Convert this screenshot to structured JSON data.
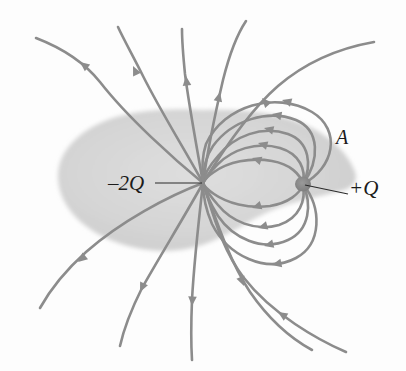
{
  "figure": {
    "background_color": "#fdfdfd",
    "field_line_color": "#8c8c8c",
    "surface_fill_color": "#d6d6d6",
    "charge_dot_color": "#8a8a8a",
    "label_color": "#1b1b1b"
  },
  "labels": {
    "negative_charge": "–2Q",
    "positive_charge": "+Q",
    "gaussian_surface": "A"
  },
  "charges": [
    {
      "name": "negative-charge",
      "label": "–2Q",
      "magnitude": "2Q",
      "sign": "negative",
      "x": 203,
      "y": 183
    },
    {
      "name": "positive-charge",
      "label": "+Q",
      "magnitude": "Q",
      "sign": "positive",
      "x": 303,
      "y": 184
    }
  ],
  "gaussian_surface": {
    "label": "A",
    "shape": "teardrop",
    "encloses": [
      "–2Q",
      "+Q"
    ],
    "left_extent": 58,
    "right_extent": 356,
    "top_extent": 110,
    "bottom_extent": 250
  },
  "field_lines": {
    "direction": "inward toward –2Q",
    "escaping_line_count": 9,
    "loop_line_count": 8,
    "arrow_note": "arrowheads point toward the negative charge"
  }
}
